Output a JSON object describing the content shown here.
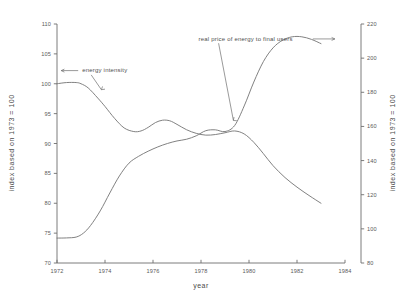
{
  "chart_data": {
    "type": "line",
    "title": "",
    "xlabel": "year",
    "ylabel": "index based on 1973 = 100",
    "y2label": "index based on 1973 = 100",
    "xlim": [
      1972,
      1984
    ],
    "ylim": [
      70,
      110
    ],
    "y2lim": [
      80,
      220
    ],
    "grid": false,
    "legend_position": "inline-annotations",
    "xticks": [
      "1972",
      "1974",
      "1976",
      "1978",
      "1980",
      "1982",
      "1984"
    ],
    "xtick_values": [
      1972,
      1974,
      1976,
      1978,
      1980,
      1982,
      1984
    ],
    "yticks": [
      "70",
      "75",
      "80",
      "85",
      "90",
      "95",
      "100",
      "105",
      "110"
    ],
    "ytick_values": [
      70,
      75,
      80,
      85,
      90,
      95,
      100,
      105,
      110
    ],
    "y2ticks": [
      "80",
      "100",
      "120",
      "140",
      "160",
      "180",
      "200",
      "220"
    ],
    "y2tick_values": [
      80,
      100,
      120,
      140,
      160,
      180,
      200,
      220
    ],
    "annotations": [
      {
        "text": "energy intensity",
        "target_series": "energy intensity",
        "text_x": 1973.05,
        "text_y": 101.9
      },
      {
        "text": "real price of energy to final users",
        "target_series": "real price of energy to final users",
        "text_x": 1977.9,
        "text_y": 107.2
      }
    ],
    "series": [
      {
        "name": "energy intensity",
        "axis": "left",
        "x": [
          1972.0,
          1972.4,
          1972.8,
          1973.0,
          1973.3,
          1973.7,
          1974.0,
          1974.4,
          1974.8,
          1975.2,
          1975.5,
          1975.8,
          1976.1,
          1976.4,
          1976.7,
          1977.0,
          1977.4,
          1977.8,
          1978.2,
          1978.6,
          1979.0,
          1979.4,
          1979.8,
          1980.2,
          1980.6,
          1981.0,
          1981.5,
          1982.0,
          1982.5,
          1983.0
        ],
        "y": [
          100.0,
          100.2,
          100.2,
          100.0,
          99.3,
          97.6,
          96.2,
          94.2,
          92.6,
          92.0,
          92.1,
          92.7,
          93.5,
          93.9,
          93.8,
          93.2,
          92.3,
          91.7,
          91.4,
          91.5,
          91.8,
          92.1,
          91.6,
          90.2,
          88.3,
          86.3,
          84.3,
          82.7,
          81.3,
          80.0
        ]
      },
      {
        "name": "real price of energy to final users",
        "axis": "right",
        "x": [
          1972.0,
          1972.4,
          1972.8,
          1973.1,
          1973.4,
          1973.8,
          1974.2,
          1974.6,
          1975.0,
          1975.4,
          1975.8,
          1976.2,
          1976.6,
          1977.0,
          1977.4,
          1977.8,
          1978.2,
          1978.6,
          1979.0,
          1979.4,
          1979.8,
          1980.2,
          1980.6,
          1981.0,
          1981.4,
          1981.8,
          1982.2,
          1982.6,
          1983.0
        ],
        "y": [
          94.6,
          94.7,
          95.2,
          97.5,
          102.0,
          110.5,
          121.0,
          131.0,
          138.5,
          142.5,
          145.5,
          148.0,
          150.0,
          151.5,
          152.5,
          154.5,
          157.5,
          158.0,
          157.0,
          160.5,
          172.0,
          186.0,
          198.0,
          206.0,
          210.5,
          212.5,
          212.5,
          211.0,
          208.5
        ]
      }
    ]
  }
}
